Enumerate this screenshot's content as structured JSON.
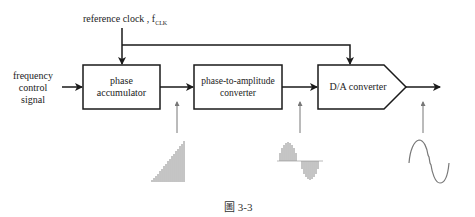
{
  "clock": {
    "label": "reference clock , f",
    "subscript": "CLK"
  },
  "input": {
    "line1": "frequency",
    "line2": "control",
    "line3": "signal"
  },
  "blocks": {
    "accumulator": {
      "line1": "phase",
      "line2": "accumulator"
    },
    "p2a": {
      "line1": "phase-to-amplitude",
      "line2": "converter"
    },
    "dac": {
      "label": "D/A converter"
    }
  },
  "waveforms": {
    "accumulator_output": "ramp-staircase",
    "p2a_output": "sampled-sine",
    "dac_output": "stepped-sine"
  },
  "caption": "圖 3-3",
  "colors": {
    "stroke": "#1a1a1a",
    "wave": "#8a8a8a"
  }
}
